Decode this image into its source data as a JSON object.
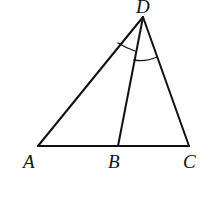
{
  "figure": {
    "points": {
      "A": {
        "label": "A",
        "x": 38,
        "y": 146
      },
      "B": {
        "label": "B",
        "x": 118,
        "y": 146
      },
      "C": {
        "label": "C",
        "x": 189,
        "y": 146
      },
      "D": {
        "label": "D",
        "x": 143,
        "y": 17
      }
    },
    "segments": [
      "AB",
      "BC",
      "AD",
      "BD",
      "CD"
    ],
    "angle_marks": [
      "ADB",
      "BDC"
    ],
    "stroke_color": "#111111"
  }
}
